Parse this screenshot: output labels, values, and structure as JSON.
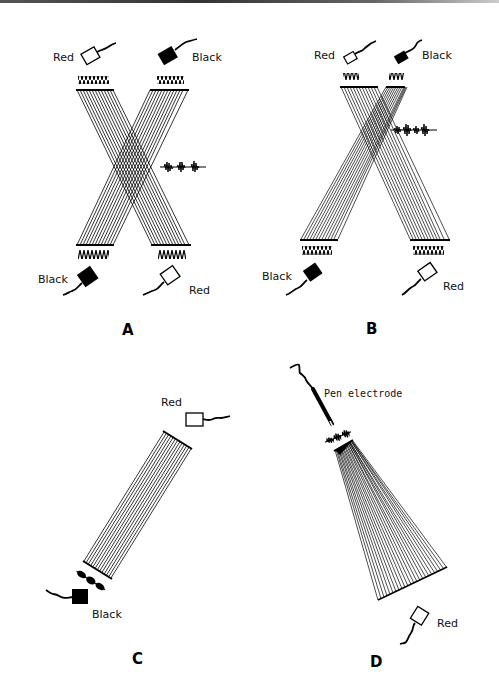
{
  "figure": {
    "panels": [
      {
        "id": "A",
        "label": "A",
        "electrodes": [
          {
            "name": "top-left",
            "label": "Red",
            "fill": "white"
          },
          {
            "name": "top-right",
            "label": "Black",
            "fill": "black"
          },
          {
            "name": "bottom-left",
            "label": "Black",
            "fill": "black"
          },
          {
            "name": "bottom-right",
            "label": "Red",
            "fill": "white"
          }
        ]
      },
      {
        "id": "B",
        "label": "B",
        "electrodes": [
          {
            "name": "top-left",
            "label": "Red",
            "fill": "white"
          },
          {
            "name": "top-right",
            "label": "Black",
            "fill": "black"
          },
          {
            "name": "bottom-left",
            "label": "Black",
            "fill": "black"
          },
          {
            "name": "bottom-right",
            "label": "Red",
            "fill": "white"
          }
        ]
      },
      {
        "id": "C",
        "label": "C",
        "electrodes": [
          {
            "name": "top-right",
            "label": "Red",
            "fill": "white"
          },
          {
            "name": "bottom-left",
            "label": "Black",
            "fill": "black"
          }
        ]
      },
      {
        "id": "D",
        "label": "D",
        "electrodes": [
          {
            "name": "pen",
            "label": "Pen electrode",
            "fill": "black"
          },
          {
            "name": "bottom-right",
            "label": "Red",
            "fill": "white"
          }
        ]
      }
    ]
  },
  "colors": {
    "ink": "#000000",
    "background": "#ffffff"
  }
}
